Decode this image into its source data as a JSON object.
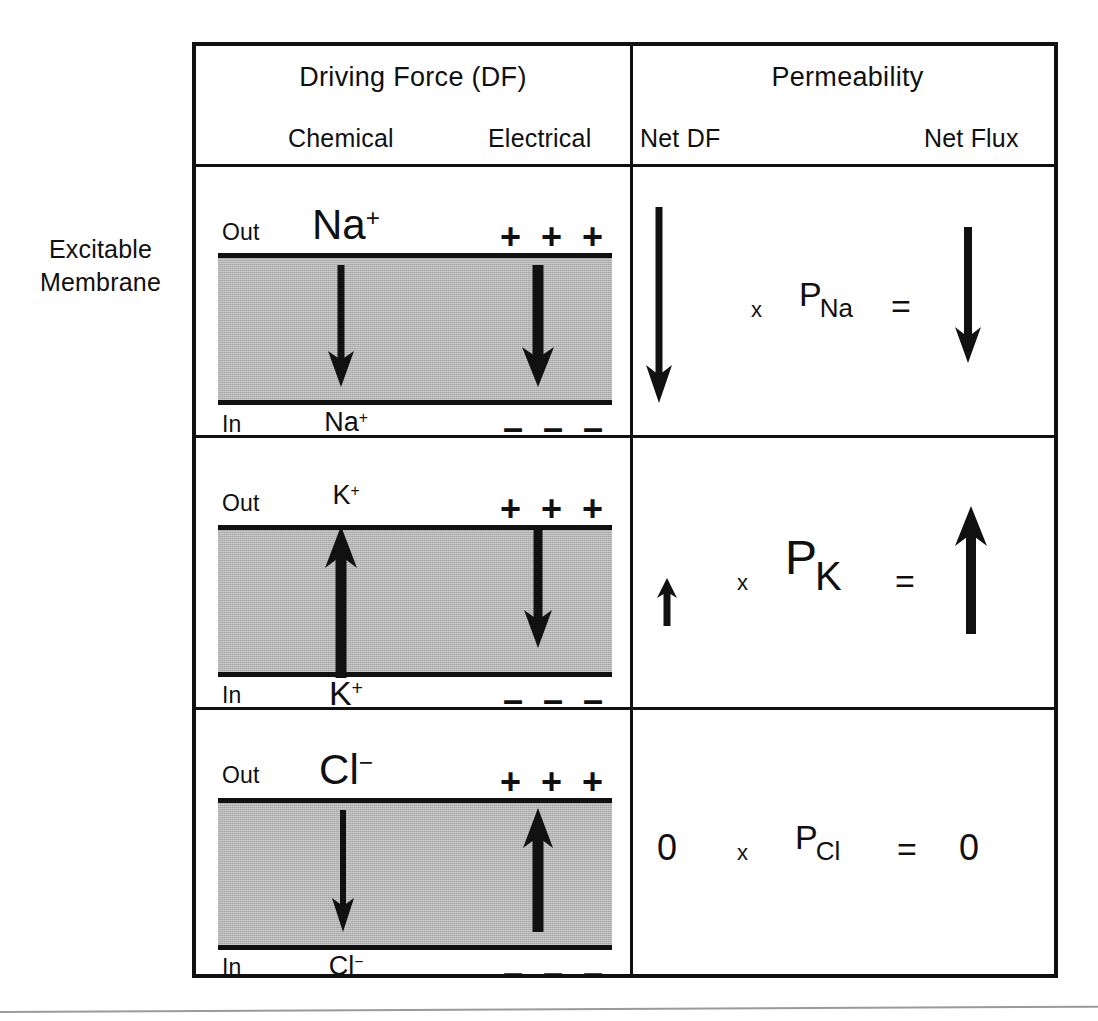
{
  "figure": {
    "side_label_line1": "Excitable",
    "side_label_line2": "Membrane"
  },
  "header": {
    "driving_force": "Driving Force (DF)",
    "permeability": "Permeability",
    "chemical": "Chemical",
    "electrical": "Electrical",
    "net_df": "Net DF",
    "net_flux": "Net Flux"
  },
  "labels": {
    "out": "Out",
    "in": "In",
    "plus": "+ + +",
    "minus": "– – –",
    "times": "x",
    "equals": "=",
    "zero": "0"
  },
  "rows": [
    {
      "ion": "Na",
      "charge": "+",
      "ion_out": "Na",
      "ion_out_sup": "+",
      "ion_in": "Na",
      "ion_in_sup": "+",
      "chemical_direction": "down",
      "electrical_direction": "down",
      "net_df_direction": "down",
      "net_df_magnitude": "large",
      "net_flux_direction": "down",
      "net_flux_magnitude": "medium",
      "permeability_symbol": "P",
      "permeability_subscript": "Na",
      "equation": "Net DF x P_Na = Net Flux"
    },
    {
      "ion": "K",
      "charge": "+",
      "ion_out": "K",
      "ion_out_sup": "+",
      "ion_in": "K",
      "ion_in_sup": "+",
      "chemical_direction": "up",
      "electrical_direction": "down",
      "net_df_direction": "up",
      "net_df_magnitude": "small",
      "net_flux_direction": "up",
      "net_flux_magnitude": "medium",
      "permeability_symbol": "P",
      "permeability_subscript": "K",
      "equation": "Net DF x P_K = Net Flux"
    },
    {
      "ion": "Cl",
      "charge": "−",
      "ion_out": "Cl",
      "ion_out_sup": "−",
      "ion_in": "Cl",
      "ion_in_sup": "−",
      "chemical_direction": "down",
      "electrical_direction": "up",
      "net_df_direction": "none",
      "net_df_magnitude": "zero",
      "net_flux_direction": "none",
      "net_flux_magnitude": "zero",
      "permeability_symbol": "P",
      "permeability_subscript": "Cl",
      "net_df_value": "0",
      "net_flux_value": "0",
      "equation": "0 x P_Cl = 0"
    }
  ],
  "colors": {
    "ink": "#111111",
    "membrane_gray": "#b4b4b4",
    "page": "#ffffff"
  }
}
